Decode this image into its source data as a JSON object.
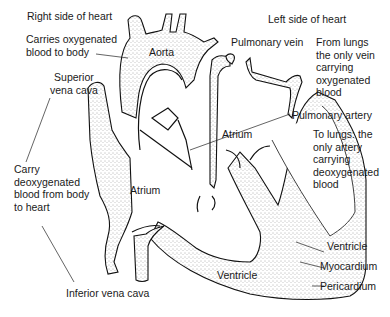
{
  "diagram": {
    "colors": {
      "ink": "#111111",
      "text": "#1a1a1a",
      "stipple": "#555555",
      "background": "#ffffff"
    },
    "sides": {
      "right": "Right side of heart",
      "left": "Left side of heart"
    },
    "labels": {
      "aorta": "Aorta",
      "aorta_note": "Carries oxygenated\nblood to body",
      "superior_vena_cava": "Superior\nvena cava",
      "vena_cava_note": "Carry\ndeoxygenated\nblood from body\nto heart",
      "inferior_vena_cava": "Inferior vena cava",
      "pulmonary_vein": "Pulmonary vein",
      "pulmonary_vein_note": "From lungs\nthe only vein\ncarrying\noxygenated\nblood",
      "pulmonary_artery": "Pulmonary artery",
      "pulmonary_artery_note": "To lungs: the\nonly artery\ncarrying\ndeoxygenated\nblood",
      "right_atrium": "Atrium",
      "left_atrium": "Atrium",
      "right_ventricle": "Ventricle",
      "left_ventricle": "Ventricle",
      "myocardium": "Myocardium",
      "pericardium": "Pericardium"
    }
  }
}
